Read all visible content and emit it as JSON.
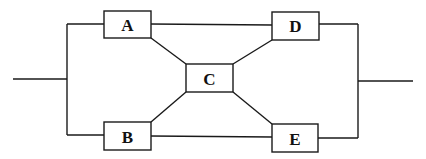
{
  "diagram": {
    "type": "block-network",
    "colors": {
      "line": "#1a1a1a",
      "box_fill": "#ffffff",
      "text": "#111111"
    },
    "nodes": [
      {
        "id": "A",
        "label": "A",
        "x": 104,
        "y": 11,
        "w": 47,
        "h": 27
      },
      {
        "id": "B",
        "label": "B",
        "x": 104,
        "y": 122,
        "w": 47,
        "h": 28
      },
      {
        "id": "C",
        "label": "C",
        "x": 186,
        "y": 64,
        "w": 47,
        "h": 28
      },
      {
        "id": "D",
        "label": "D",
        "x": 272,
        "y": 12,
        "w": 47,
        "h": 28
      },
      {
        "id": "E",
        "label": "E",
        "x": 272,
        "y": 124,
        "w": 46,
        "h": 28
      }
    ],
    "edges": [
      {
        "from": "input",
        "to": "A"
      },
      {
        "from": "input",
        "to": "B"
      },
      {
        "from": "A",
        "to": "D"
      },
      {
        "from": "B",
        "to": "E"
      },
      {
        "from": "A",
        "to": "C"
      },
      {
        "from": "B",
        "to": "C"
      },
      {
        "from": "C",
        "to": "D"
      },
      {
        "from": "C",
        "to": "E"
      },
      {
        "from": "D",
        "to": "output"
      },
      {
        "from": "E",
        "to": "output"
      }
    ]
  }
}
